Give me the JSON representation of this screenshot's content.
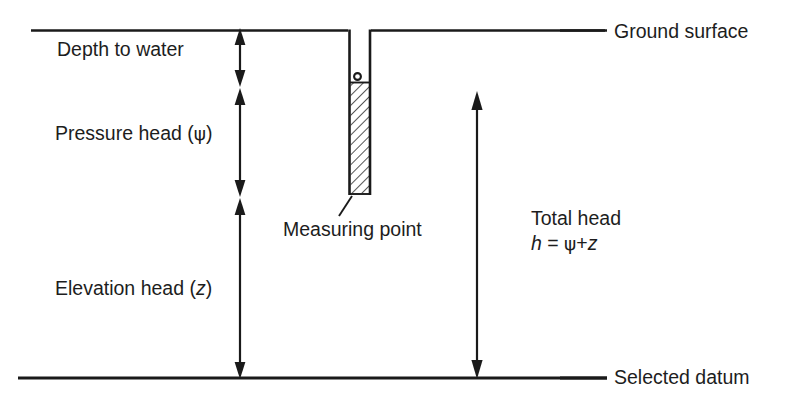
{
  "diagram": {
    "type": "technical-line-diagram",
    "background_color": "#ffffff",
    "line_color": "#1a1a1a",
    "text_color": "#1d1d1d",
    "labels": {
      "depth_to_water": "Depth to water",
      "pressure_head": "Pressure head (",
      "pressure_head_symbol": "ψ",
      "pressure_head_close": ")",
      "elevation_head": "Elevation head (",
      "elevation_head_symbol": "z",
      "elevation_head_close": ")",
      "measuring_point": "Measuring point",
      "total_head": "Total head",
      "total_head_formula_h": "h",
      "total_head_formula_eq": " = ",
      "total_head_formula_psi": "ψ",
      "total_head_formula_plus": "+",
      "total_head_formula_z": "z",
      "ground_surface": "Ground surface",
      "selected_datum": "Selected datum"
    },
    "geometry": {
      "ground_surface_y": 30,
      "datum_y": 378,
      "well_left_x": 348,
      "well_right_x": 371,
      "well_bottom_y": 195,
      "screen_top_y": 82,
      "screen_bottom_y": 193,
      "water_marker_y": 79,
      "dim_chain_x": 240,
      "depth_to_water_bottom_y": 85,
      "pressure_head_bottom_y": 195,
      "total_head_x": 477,
      "total_head_top_y": 93
    }
  }
}
